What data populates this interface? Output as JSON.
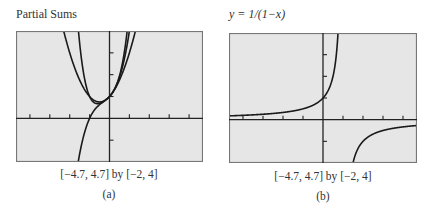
{
  "panels": [
    {
      "id": "a",
      "title": "Partial Sums",
      "window_caption": "[−4.7, 4.7] by [−2, 4]",
      "sublabel": "(a)"
    },
    {
      "id": "b",
      "title": "y = 1/(1−x)",
      "window_caption": "[−4.7, 4.7] by [−2, 4]",
      "sublabel": "(b)"
    }
  ],
  "colors": {
    "plot_bg": "#e6e6e6",
    "frame": "#777777",
    "curve": "#1a1a1a",
    "axis": "#222222"
  },
  "chart_data": [
    {
      "type": "line",
      "title": "Partial Sums",
      "xlim": [
        -4.7,
        4.7
      ],
      "ylim": [
        -2,
        4
      ],
      "xticks": [
        -4,
        -3,
        -2,
        -1,
        1,
        2,
        3,
        4
      ],
      "yticks": [
        -1,
        1,
        2,
        3
      ],
      "grid": false,
      "series": [
        {
          "name": "P1 = 1 + x",
          "formula": "1+x"
        },
        {
          "name": "P2 = 1 + x + x^2",
          "formula": "1+x+x^2"
        },
        {
          "name": "P3 = 1 + x + x^2 + x^3",
          "formula": "1+x+x^2+x^3"
        },
        {
          "name": "P4 = 1 + x + x^2 + x^3 + x^4",
          "formula": "1+x+x^2+x^3+x^4"
        }
      ],
      "note": "Curves shown: cubic-like curve descending steeply left, and parabola-like partial sums meeting near (0,1)",
      "xlabel": "[−4.7, 4.7] by [−2, 4]",
      "sublabel": "(a)"
    },
    {
      "type": "line",
      "title": "y = 1/(1−x)",
      "xlim": [
        -4.7,
        4.7
      ],
      "ylim": [
        -2,
        4
      ],
      "xticks": [
        -4,
        -3,
        -2,
        -1,
        1,
        2,
        3,
        4
      ],
      "yticks": [
        -1,
        1,
        2,
        3
      ],
      "grid": false,
      "series": [
        {
          "name": "y = 1/(1−x)",
          "formula": "1/(1-x)",
          "asymptote_x": 1
        }
      ],
      "xlabel": "[−4.7, 4.7] by [−2, 4]",
      "sublabel": "(b)"
    }
  ]
}
